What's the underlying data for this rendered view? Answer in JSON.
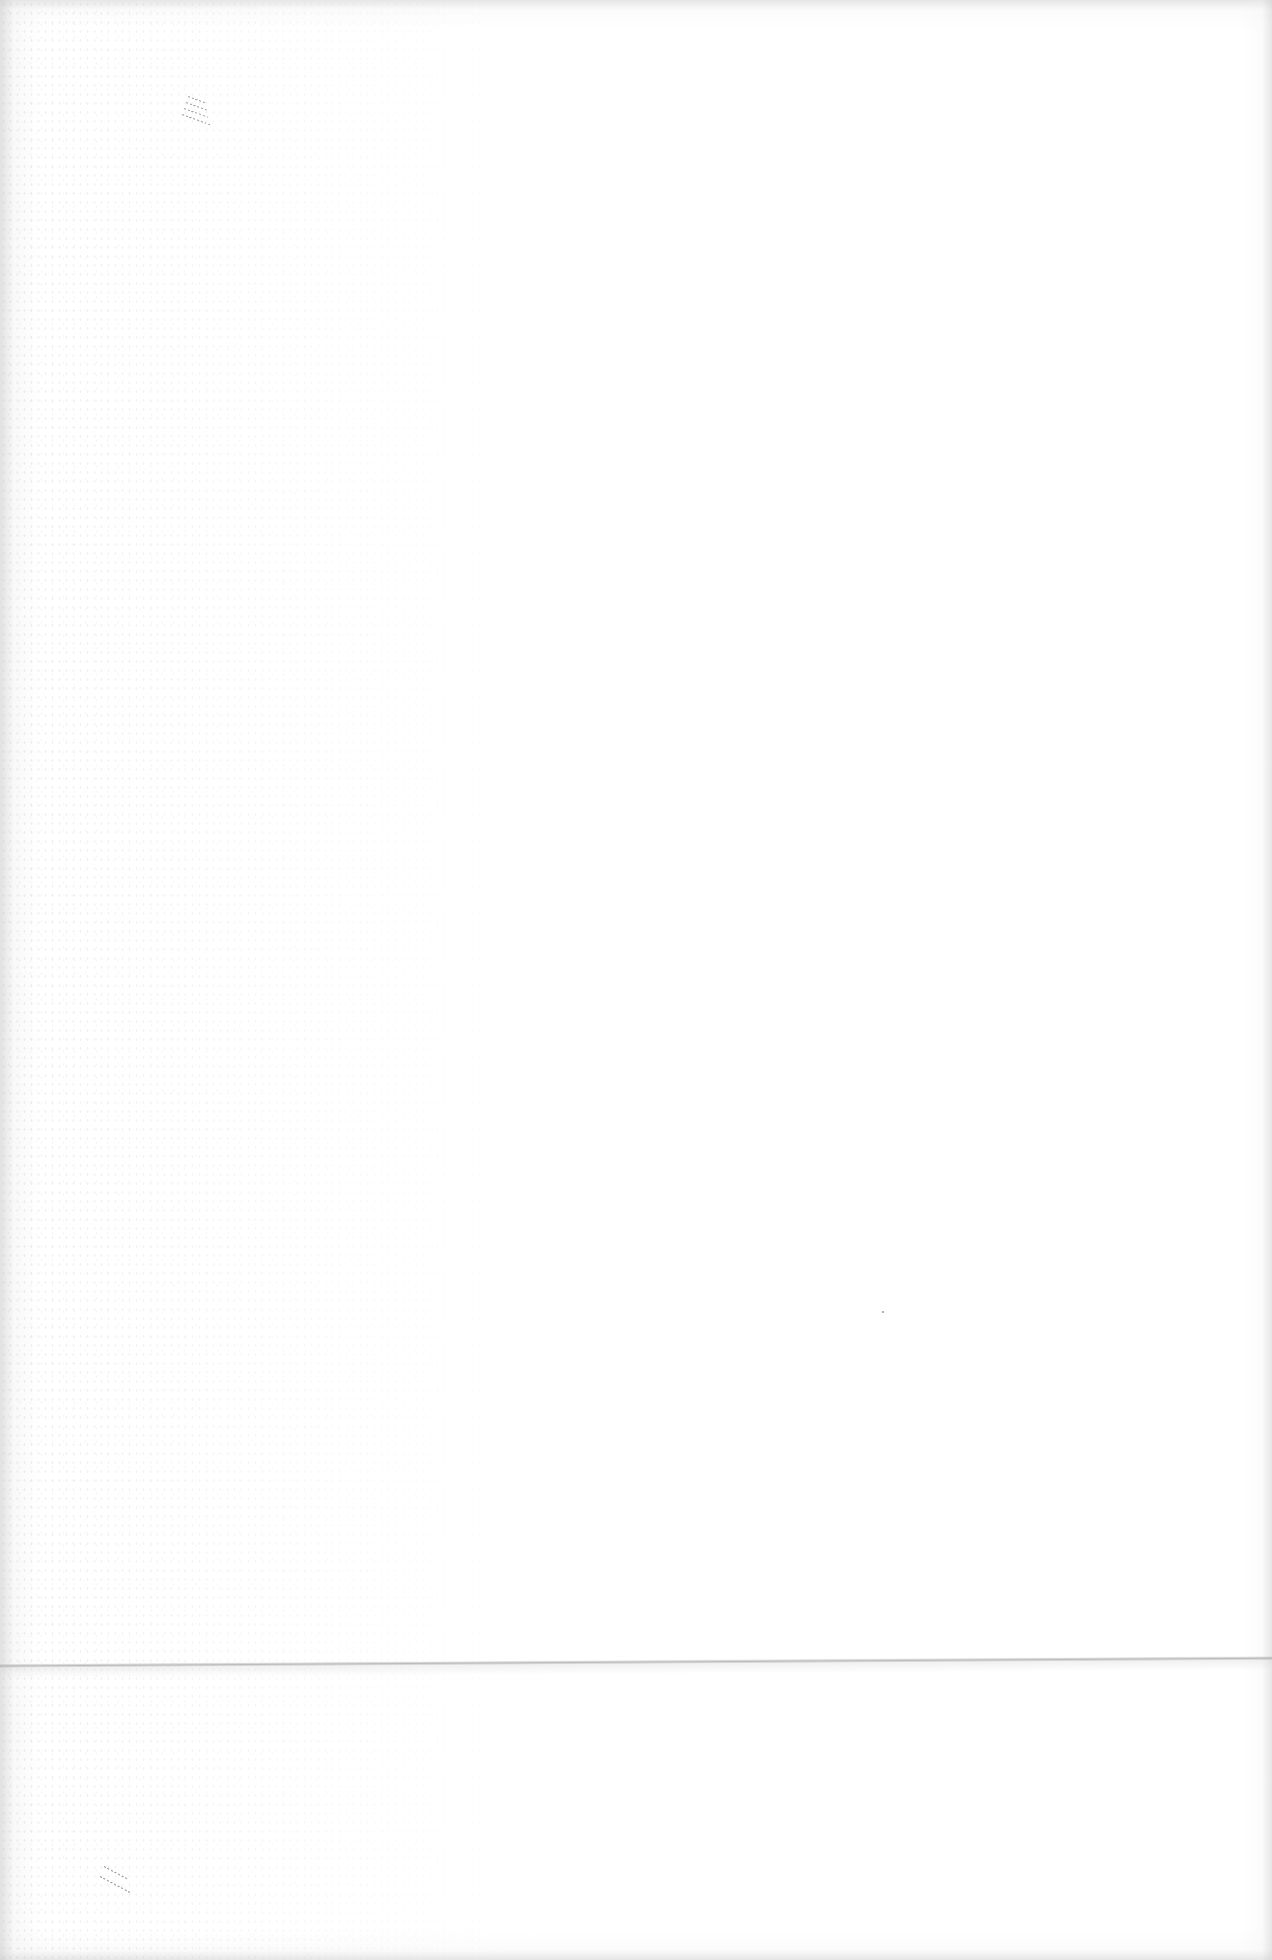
{
  "page": {
    "kind": "blank scanned page",
    "visible_text": [],
    "colors": {
      "paper": "#ffffff",
      "edge_shade": "#c8c8c8",
      "fold_line": "#a5a5a5",
      "pen_marks": "#787878"
    },
    "features": {
      "fold_line": "horizontal fold/crease near bottom of page",
      "pen_marks": [
        "faint diagonal strokes top-left",
        "faint diagonal strokes bottom-left"
      ],
      "specks": [
        "small dot near center-right"
      ]
    }
  }
}
